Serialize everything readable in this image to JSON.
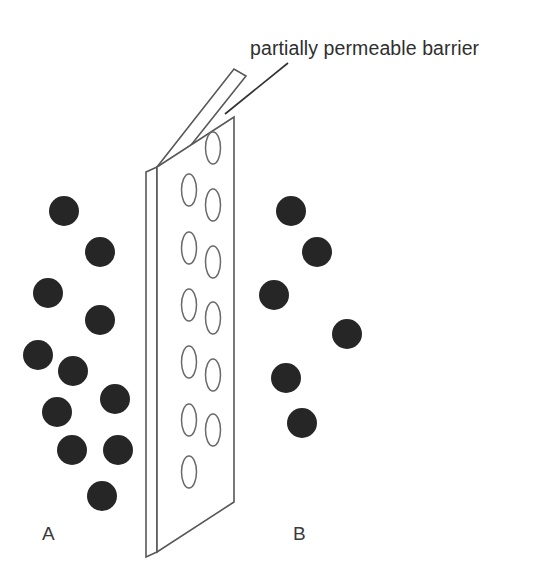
{
  "figure": {
    "title_label": "partially permeable barrier",
    "background_color": "#ffffff",
    "particle_color": "#262626",
    "line_color": "#58585a",
    "pore_stroke_color": "#6a6a6c",
    "text_color": "#2f2f2f"
  },
  "annotations": {
    "caption": "partially permeable barrier",
    "caption_x": 250,
    "caption_y": 55,
    "leader_line": {
      "x1": 288,
      "y1": 63,
      "x2": 225,
      "y2": 114
    }
  },
  "compartments": [
    {
      "id": "A",
      "label": "A",
      "label_x": 42,
      "label_y": 540,
      "particle_count": 11,
      "concentration": "high"
    },
    {
      "id": "B",
      "label": "B",
      "label_x": 293,
      "label_y": 540,
      "particle_count": 6,
      "concentration": "low"
    }
  ],
  "barrier": {
    "name": "partially permeable barrier",
    "description": "three-dimensional slab drawn in oblique perspective with elliptical pores",
    "front_face": {
      "points": "157,167 157,552 234,502 234,117"
    },
    "top_face": {
      "points": "157,167 234,69 246,76 168,174"
    },
    "left_edge_face": {
      "points": "146,172 157,167 157,552 146,557"
    },
    "pore_size": {
      "rx": 7.5,
      "ry": 16
    },
    "pore_columns": [
      {
        "column": "right",
        "cx": 213,
        "pores_y": [
          148,
          205,
          262,
          318,
          375,
          430
        ]
      },
      {
        "column": "left",
        "cx": 189,
        "pores_y": [
          190,
          248,
          305,
          362,
          420,
          472
        ]
      }
    ]
  },
  "particles": {
    "radius": 15,
    "side_a": [
      {
        "cx": 64,
        "cy": 211
      },
      {
        "cx": 100,
        "cy": 252
      },
      {
        "cx": 48,
        "cy": 293
      },
      {
        "cx": 100,
        "cy": 320
      },
      {
        "cx": 38,
        "cy": 355
      },
      {
        "cx": 73,
        "cy": 371
      },
      {
        "cx": 115,
        "cy": 399
      },
      {
        "cx": 57,
        "cy": 412
      },
      {
        "cx": 72,
        "cy": 450
      },
      {
        "cx": 118,
        "cy": 450
      },
      {
        "cx": 102,
        "cy": 496
      }
    ],
    "side_b": [
      {
        "cx": 291,
        "cy": 211
      },
      {
        "cx": 317,
        "cy": 252
      },
      {
        "cx": 274,
        "cy": 295
      },
      {
        "cx": 347,
        "cy": 334
      },
      {
        "cx": 286,
        "cy": 378
      },
      {
        "cx": 302,
        "cy": 423
      }
    ]
  }
}
